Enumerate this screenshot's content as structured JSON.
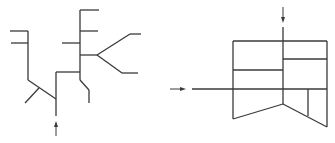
{
  "diagram": {
    "stroke_color": "#3a3a3a",
    "background": "#ffffff",
    "left_figure": {
      "description": "branching tree line network with upward inlet arrow",
      "inlet_arrow": {
        "direction": "up",
        "x": 56,
        "y_from": 135,
        "y_to": 121
      }
    },
    "right_figure": {
      "description": "partitioned box with pentagonal lower section, top and left inlet arrows",
      "top_arrow": {
        "direction": "down",
        "x": 283
      },
      "left_arrow": {
        "direction": "right",
        "y": 89
      }
    }
  }
}
